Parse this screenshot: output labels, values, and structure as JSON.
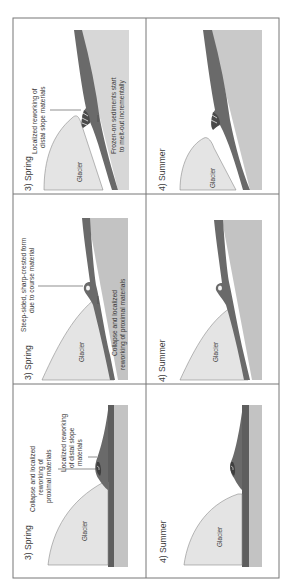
{
  "figure": {
    "orientation": "rotated-90-ccw",
    "columns": [
      "spring",
      "summer"
    ],
    "colors": {
      "border": "#777777",
      "glacier": "#e4e4e4",
      "glacier_outline": "#8a8a8a",
      "sediment": "#6a6a6a",
      "sediment_dark": "#4a4a4a",
      "bedrock": "#c3c3c3",
      "bedrock_light": "#d7d7d7",
      "text": "#3a3a3a"
    }
  },
  "rows": [
    {
      "spring": {
        "title": "3) Spring",
        "glacier_label": "Glacier",
        "annotations": [
          "Localized reworking of",
          "distal slope materials",
          "Frozen-on sediments start",
          "to melt-out incrementally"
        ]
      },
      "summer": {
        "title": "4) Summer",
        "glacier_label": "Glacier"
      }
    },
    {
      "spring": {
        "title": "3) Spring",
        "glacier_label": "Glacier",
        "annotations": [
          "Steep-sided, sharp-crested form",
          "due to course material",
          "Collapse and localized",
          "reworking of proximal materials"
        ]
      },
      "summer": {
        "title": "4) Summer",
        "glacier_label": "Glacier"
      }
    },
    {
      "spring": {
        "title": "3) Spring",
        "glacier_label": "Glacier",
        "annotations": [
          "Collapse and localized",
          "reworking of",
          "proximal materials",
          "Localized reworking",
          "of distal slope",
          "materials"
        ]
      },
      "summer": {
        "title": "4) Summer",
        "glacier_label": "Glacier"
      }
    }
  ]
}
